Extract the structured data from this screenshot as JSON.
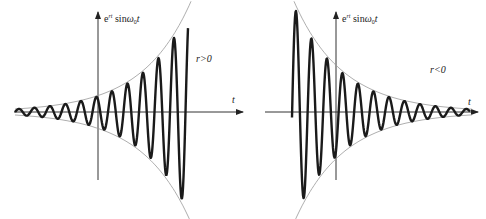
{
  "left_plot": {
    "y_label_base": "e",
    "y_label_exp": "rt",
    "y_label_rest": " sin",
    "y_label_omega": "ω",
    "y_label_sub": "0",
    "y_label_t": "t",
    "x_label": "t",
    "condition": "r>0",
    "description": "growing oscillation"
  },
  "right_plot": {
    "y_label_base": "e",
    "y_label_exp": "rt",
    "y_label_rest": " sin",
    "y_label_omega": "ω",
    "y_label_sub": "0",
    "y_label_t": "t",
    "x_label": "t",
    "condition": "r<0",
    "description": "decaying oscillation"
  },
  "colors": {
    "axis": "#333333",
    "curve": "#1a1a1a",
    "envelope": "#999999"
  }
}
